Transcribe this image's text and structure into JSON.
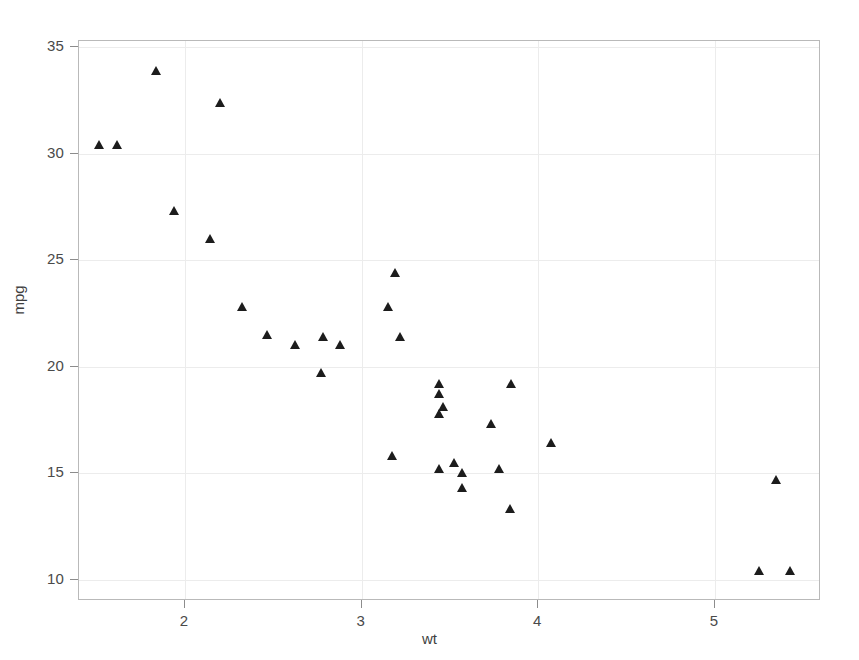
{
  "chart_data": {
    "type": "scatter",
    "title": "",
    "xlabel": "wt",
    "ylabel": "mpg",
    "xlim": [
      1.4,
      5.6
    ],
    "ylim": [
      9.0,
      35.3
    ],
    "xticks": [
      2,
      3,
      4,
      5
    ],
    "xticklabels": [
      "2",
      "3",
      "4",
      "5"
    ],
    "yticks": [
      10,
      15,
      20,
      25,
      30,
      35
    ],
    "yticklabels": [
      "10",
      "15",
      "20",
      "25",
      "30",
      "35"
    ],
    "grid": true,
    "legend": null,
    "marker": "triangle-up",
    "marker_color": "#1c1c1c",
    "grid_color": "#ececec",
    "frame_color": "#b9b9b9",
    "x": [
      2.62,
      2.875,
      2.32,
      3.215,
      3.44,
      3.46,
      3.57,
      3.19,
      3.15,
      3.44,
      3.44,
      4.07,
      3.73,
      3.78,
      5.25,
      5.424,
      5.345,
      2.2,
      1.615,
      1.835,
      2.465,
      3.52,
      3.435,
      3.84,
      3.845,
      1.935,
      2.14,
      1.513,
      3.17,
      2.77,
      3.57,
      2.78
    ],
    "y": [
      21.0,
      21.0,
      22.8,
      21.4,
      18.7,
      18.1,
      14.3,
      24.4,
      22.8,
      19.2,
      17.8,
      16.4,
      17.3,
      15.2,
      10.4,
      10.4,
      14.7,
      32.4,
      30.4,
      33.9,
      21.5,
      15.5,
      15.2,
      13.3,
      19.2,
      27.3,
      26.0,
      30.4,
      15.8,
      19.7,
      15.0,
      21.4
    ]
  },
  "axis": {
    "ylabel": "mpg",
    "xlabel": "wt"
  }
}
